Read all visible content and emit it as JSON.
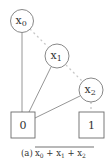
{
  "diagram": {
    "type": "binary-decision-diagram",
    "nodes": [
      {
        "id": "x0",
        "label": "x",
        "sub": "0",
        "cx": 22,
        "cy": 21,
        "r": 11.5
      },
      {
        "id": "x1",
        "label": "x",
        "sub": "1",
        "cx": 57,
        "cy": 56,
        "r": 12
      },
      {
        "id": "x2",
        "label": "x",
        "sub": "2",
        "cx": 91,
        "cy": 90,
        "r": 12
      }
    ],
    "terminals": [
      {
        "id": "t0",
        "label": "0",
        "x": 11,
        "y": 112,
        "w": 24,
        "h": 26
      },
      {
        "id": "t1",
        "label": "1",
        "x": 79,
        "y": 112,
        "w": 25,
        "h": 26
      }
    ],
    "edges": [
      {
        "from": "x0",
        "to": "x1",
        "style": "dashed"
      },
      {
        "from": "x0",
        "to": "t0",
        "style": "solid"
      },
      {
        "from": "x1",
        "to": "x2",
        "style": "dashed"
      },
      {
        "from": "x1",
        "to": "t0",
        "style": "solid"
      },
      {
        "from": "x2",
        "to": "t0",
        "style": "solid"
      },
      {
        "from": "x2",
        "to": "t1",
        "style": "dashed"
      }
    ],
    "caption": {
      "prefix": "(a)",
      "expression": "x0 + x1 + x2",
      "overlined": true
    }
  },
  "colors": {
    "stroke": "#7a7a7a",
    "dashed": "#c8c8c8",
    "text": "#333333"
  }
}
